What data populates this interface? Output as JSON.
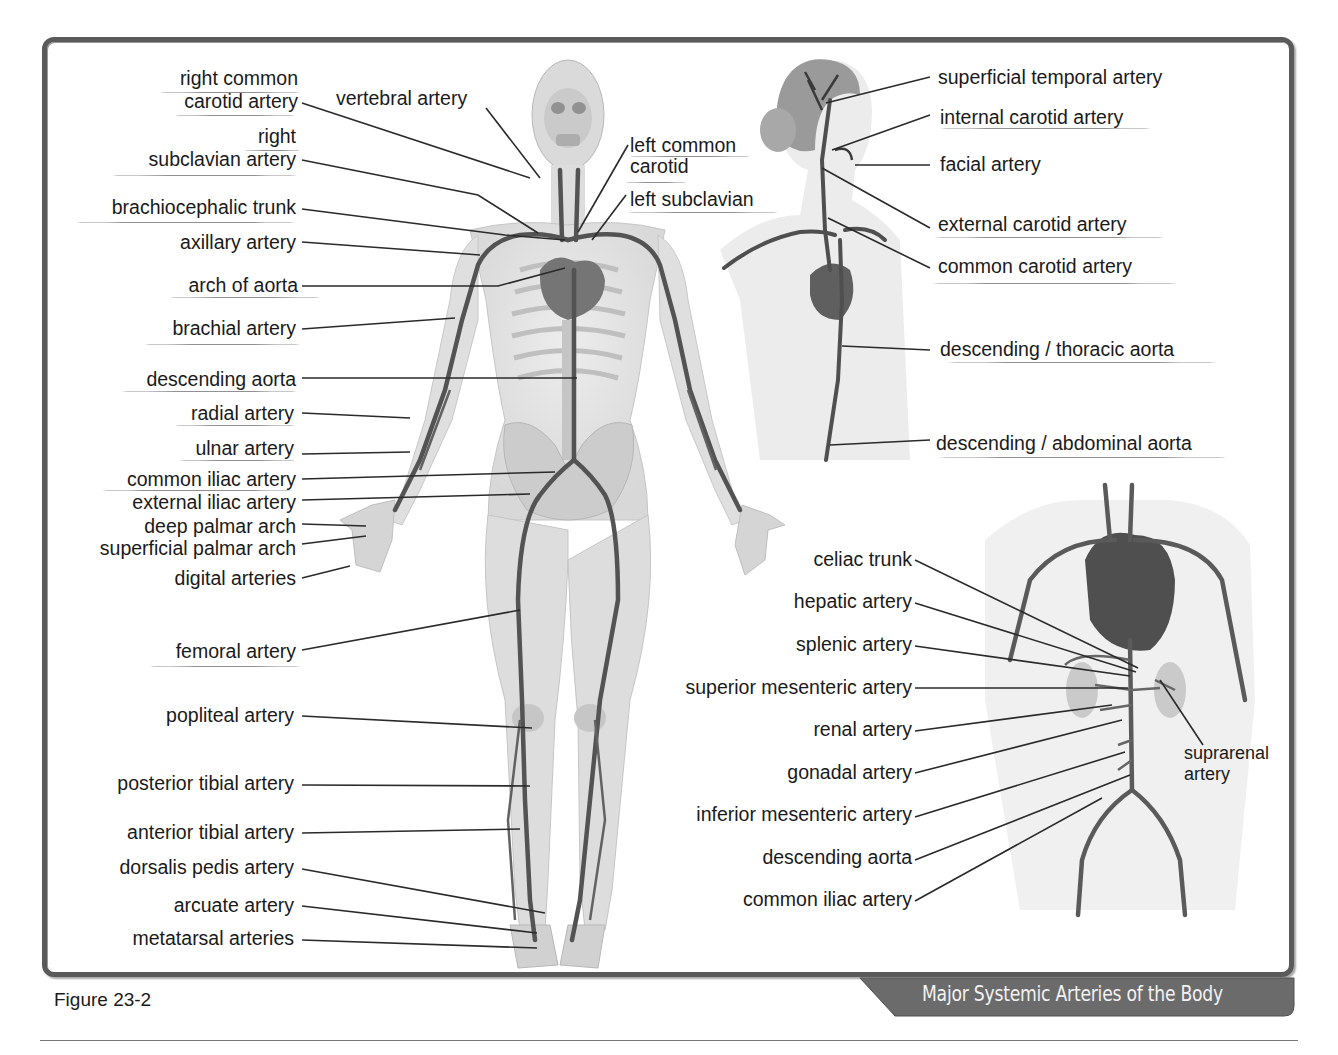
{
  "figure": {
    "caption": "Figure 23-2",
    "title": "Major Systemic Arteries of the Body"
  },
  "full_body_labels": {
    "right_common_carotid_line1": "right common",
    "right_common_carotid_line2": "carotid artery",
    "vertebral_artery": "vertebral artery",
    "right_subclavian_line1": "right",
    "right_subclavian_line2": "subclavian artery",
    "brachiocephalic_trunk": "brachiocephalic trunk",
    "axillary_artery": "axillary artery",
    "arch_of_aorta": "arch of aorta",
    "brachial_artery": "brachial artery",
    "descending_aorta": "descending aorta",
    "radial_artery": "radial artery",
    "ulnar_artery": "ulnar artery",
    "common_iliac_artery": "common iliac artery",
    "external_iliac_artery": "external iliac artery",
    "deep_palmar_arch": "deep palmar arch",
    "superficial_palmar_arch": "superficial palmar arch",
    "digital_arteries": "digital arteries",
    "femoral_artery": "femoral artery",
    "popliteal_artery": "popliteal artery",
    "posterior_tibial_artery": "posterior tibial artery",
    "anterior_tibial_artery": "anterior tibial artery",
    "dorsalis_pedis_artery": "dorsalis pedis artery",
    "arcuate_artery": "arcuate artery",
    "metatarsal_arteries": "metatarsal arteries",
    "left_common_carotid_line1": "left common",
    "left_common_carotid_line2": "carotid",
    "left_subclavian": "left subclavian"
  },
  "head_neck_labels": {
    "superficial_temporal_artery": "superficial temporal artery",
    "internal_carotid_artery": "internal carotid artery",
    "facial_artery": "facial artery",
    "external_carotid_artery": "external carotid artery",
    "common_carotid_artery": "common carotid artery",
    "descending_thoracic_aorta": "descending / thoracic aorta",
    "descending_abdominal_aorta": "descending / abdominal aorta"
  },
  "abdominal_labels": {
    "celiac_trunk": "celiac trunk",
    "hepatic_artery": "hepatic artery",
    "splenic_artery": "splenic artery",
    "superior_mesenteric_artery": "superior mesenteric artery",
    "renal_artery": "renal artery",
    "gonadal_artery": "gonadal artery",
    "inferior_mesenteric_artery": "inferior mesenteric artery",
    "descending_aorta": "descending aorta",
    "common_iliac_artery": "common iliac artery",
    "suprarenal_line1": "suprarenal",
    "suprarenal_line2": "artery"
  },
  "colors": {
    "frame": "#5a5a5a",
    "banner": "#6b6b6b",
    "banner_text": "#f2f2f2",
    "artery": "#4a4a4a",
    "body_fill": "#e6e6e6",
    "leader_line": "#2a2a2a"
  }
}
